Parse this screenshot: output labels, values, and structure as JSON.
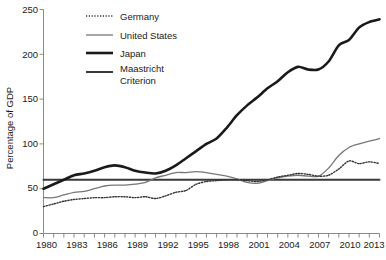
{
  "chart_data": {
    "type": "line",
    "title": "",
    "xlabel": "",
    "ylabel": "Percentage of GDP",
    "xlim": [
      1980,
      2013
    ],
    "ylim": [
      0,
      250
    ],
    "grid": false,
    "legend_position": "top-left",
    "y_ticks": [
      0,
      50,
      100,
      150,
      200,
      250
    ],
    "x_ticks_labeled": [
      1980,
      1983,
      1986,
      1989,
      1992,
      1995,
      1998,
      2001,
      2004,
      2007,
      2010,
      2013
    ],
    "x_ticks_all": [
      1980,
      1981,
      1982,
      1983,
      1984,
      1985,
      1986,
      1987,
      1988,
      1989,
      1990,
      1991,
      1992,
      1993,
      1994,
      1995,
      1996,
      1997,
      1998,
      1999,
      2000,
      2001,
      2002,
      2003,
      2004,
      2005,
      2006,
      2007,
      2008,
      2009,
      2010,
      2011,
      2012,
      2013
    ],
    "x": [
      1980,
      1981,
      1982,
      1983,
      1984,
      1985,
      1986,
      1987,
      1988,
      1989,
      1990,
      1991,
      1992,
      1993,
      1994,
      1995,
      1996,
      1997,
      1998,
      1999,
      2000,
      2001,
      2002,
      2003,
      2004,
      2005,
      2006,
      2007,
      2008,
      2009,
      2010,
      2011,
      2012,
      2013
    ],
    "series": [
      {
        "name": "Germany",
        "style": "dotted",
        "color": "#333333",
        "width": 1.4,
        "values": [
          30,
          33,
          36,
          38,
          39,
          40,
          40,
          41,
          41,
          40,
          41,
          39,
          42,
          46,
          48,
          55,
          58,
          59,
          60,
          60,
          59,
          58,
          60,
          63,
          65,
          67,
          66,
          64,
          65,
          72,
          81,
          78,
          80,
          78
        ]
      },
      {
        "name": "United States",
        "style": "solid",
        "color": "#777777",
        "width": 1.3,
        "values": [
          40,
          40,
          43,
          46,
          47,
          50,
          53,
          54,
          54,
          55,
          57,
          62,
          65,
          68,
          68,
          69,
          68,
          66,
          64,
          61,
          57,
          56,
          59,
          62,
          64,
          65,
          64,
          64,
          73,
          87,
          96,
          100,
          103,
          106
        ]
      },
      {
        "name": "Japan",
        "style": "solid",
        "color": "#1a1a1a",
        "width": 2.6,
        "values": [
          50,
          55,
          60,
          65,
          67,
          70,
          74,
          76,
          74,
          70,
          68,
          67,
          70,
          76,
          84,
          92,
          100,
          106,
          118,
          132,
          143,
          152,
          162,
          170,
          180,
          186,
          183,
          183,
          192,
          210,
          216,
          230,
          236,
          239
        ]
      },
      {
        "name": "Maastricht Criterion",
        "style": "solid",
        "color": "#3a3a3a",
        "width": 2.0,
        "values": [
          60,
          60,
          60,
          60,
          60,
          60,
          60,
          60,
          60,
          60,
          60,
          60,
          60,
          60,
          60,
          60,
          60,
          60,
          60,
          60,
          60,
          60,
          60,
          60,
          60,
          60,
          60,
          60,
          60,
          60,
          60,
          60,
          60,
          60
        ]
      }
    ],
    "legend": [
      {
        "label": "Germany",
        "style": "dotted",
        "color": "#333333"
      },
      {
        "label": "United States",
        "style": "solid",
        "color": "#777777"
      },
      {
        "label": "Japan",
        "style": "solid",
        "color": "#1a1a1a"
      },
      {
        "label": "Maastricht Criterion",
        "style": "solid",
        "color": "#3a3a3a"
      }
    ]
  },
  "legend": {
    "germany": "Germany",
    "united_states": "United States",
    "japan": "Japan",
    "maastricht_line1": "Maastricht",
    "maastricht_line2": "Criterion"
  },
  "axes": {
    "y_title": "Percentage of GDP",
    "y_tick_0": "0",
    "y_tick_50": "50",
    "y_tick_100": "100",
    "y_tick_150": "150",
    "y_tick_200": "200",
    "y_tick_250": "250",
    "x_tick_1980": "1980",
    "x_tick_1983": "1983",
    "x_tick_1986": "1986",
    "x_tick_1989": "1989",
    "x_tick_1992": "1992",
    "x_tick_1995": "1995",
    "x_tick_1998": "1998",
    "x_tick_2001": "2001",
    "x_tick_2004": "2004",
    "x_tick_2007": "2007",
    "x_tick_2010": "2010",
    "x_tick_2013": "2013"
  }
}
